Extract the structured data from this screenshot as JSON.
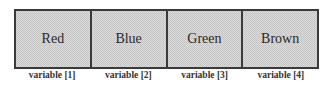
{
  "diagram": {
    "cells": [
      {
        "value": "Red",
        "label": "variable [1]"
      },
      {
        "value": "Blue",
        "label": "variable [2]"
      },
      {
        "value": "Green",
        "label": "variable [3]"
      },
      {
        "value": "Brown",
        "label": "variable [4]"
      }
    ]
  }
}
